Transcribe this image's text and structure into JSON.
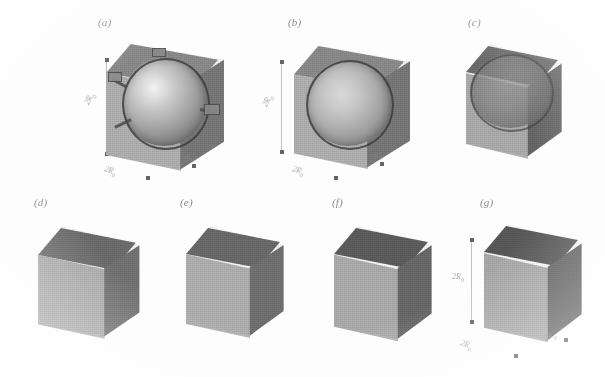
{
  "figure": {
    "type": "scientific-figure",
    "rendering": "grayscale 3d solid models",
    "background_color": "#fdfdfd",
    "panel_count": 7
  },
  "colors": {
    "face_top": "#8e8e8e",
    "face_left": "#b4b4b4",
    "face_right": "#7b7b7b",
    "sphere_highlight": "#f2f2f2",
    "sphere_shadow": "#636363",
    "edge_dark": "#3a3a3a",
    "annotation": "#8a8a8a"
  },
  "panels": [
    {
      "id": "a",
      "label": "(a)",
      "row": 1,
      "shape": "sphere-in-cube",
      "sphere_visible": true,
      "truncation": 0.0,
      "has_arrows": true,
      "has_nubs": true,
      "dimensions": {
        "vertical": "2R",
        "vertical_sub": "0",
        "bottom_left": "2R",
        "bottom_left_sub": "0",
        "bottom_right": "2R",
        "bottom_right_sub": "0"
      }
    },
    {
      "id": "b",
      "label": "(b)",
      "row": 1,
      "shape": "sphere-in-cube",
      "sphere_visible": true,
      "truncation": 0.08,
      "has_arrows": false,
      "has_nubs": false,
      "dimensions": {
        "vertical": "2R",
        "vertical_sub": "0",
        "bottom_left": "2R",
        "bottom_left_sub": "0",
        "bottom_right": "2R",
        "bottom_right_sub": "0"
      }
    },
    {
      "id": "c",
      "label": "(c)",
      "row": 1,
      "shape": "truncated-sphere-cube",
      "sphere_visible": true,
      "truncation": 0.28,
      "has_arrows": false,
      "has_nubs": false,
      "dimensions": null
    },
    {
      "id": "d",
      "label": "(d)",
      "row": 2,
      "shape": "rounded-cube",
      "sphere_visible": false,
      "truncation": 0.48,
      "has_arrows": false,
      "has_nubs": false,
      "dimensions": null
    },
    {
      "id": "e",
      "label": "(e)",
      "row": 2,
      "shape": "rounded-cube",
      "sphere_visible": false,
      "truncation": 0.66,
      "has_arrows": false,
      "has_nubs": false,
      "dimensions": null
    },
    {
      "id": "f",
      "label": "(f)",
      "row": 2,
      "shape": "near-cube",
      "sphere_visible": false,
      "truncation": 0.84,
      "has_arrows": false,
      "has_nubs": false,
      "dimensions": null
    },
    {
      "id": "g",
      "label": "(g)",
      "row": 2,
      "shape": "cube",
      "sphere_visible": false,
      "truncation": 1.0,
      "has_arrows": false,
      "has_nubs": false,
      "dimensions": {
        "vertical": "2R",
        "vertical_sub": "0",
        "bottom_left": "2R",
        "bottom_left_sub": "0",
        "bottom_right": "2R",
        "bottom_right_sub": "0"
      }
    }
  ]
}
